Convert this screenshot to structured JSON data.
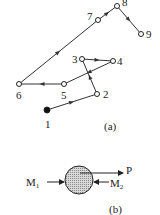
{
  "figure_a": {
    "caption": "(a)",
    "nodes": [
      {
        "id": "1",
        "x": 47,
        "y": 110,
        "filled": true,
        "label_x": 45,
        "label_y": 128
      },
      {
        "id": "2",
        "x": 97,
        "y": 94,
        "filled": false,
        "label_x": 103,
        "label_y": 98
      },
      {
        "id": "3",
        "x": 82,
        "y": 59,
        "filled": false,
        "label_x": 72,
        "label_y": 63
      },
      {
        "id": "4",
        "x": 113,
        "y": 61,
        "filled": false,
        "label_x": 117,
        "label_y": 65
      },
      {
        "id": "5",
        "x": 64,
        "y": 84,
        "filled": false,
        "label_x": 61,
        "label_y": 99
      },
      {
        "id": "6",
        "x": 19,
        "y": 84,
        "filled": false,
        "label_x": 16,
        "label_y": 99
      },
      {
        "id": "7",
        "x": 98,
        "y": 20,
        "filled": false,
        "label_x": 87,
        "label_y": 20
      },
      {
        "id": "8",
        "x": 117,
        "y": 6,
        "filled": false,
        "label_x": 122,
        "label_y": 6
      },
      {
        "id": "9",
        "x": 141,
        "y": 34,
        "filled": false,
        "label_x": 146,
        "label_y": 38
      }
    ],
    "path": [
      "1",
      "2",
      "3",
      "4",
      "5",
      "6",
      "7",
      "8",
      "9"
    ]
  },
  "figure_b": {
    "caption": "(b)",
    "labels": {
      "m1": "M",
      "m1_sub": "1",
      "m2": "M",
      "m2_sub": "2",
      "p": "P"
    }
  }
}
